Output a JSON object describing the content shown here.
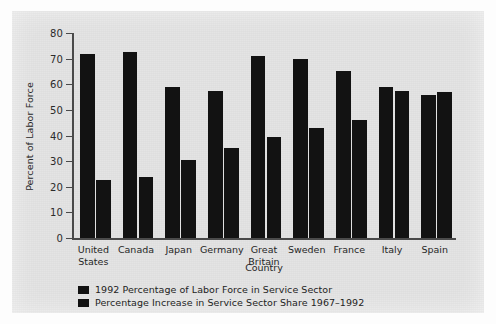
{
  "chart_data": {
    "type": "bar",
    "title": "",
    "xlabel": "Country",
    "ylabel": "Percent of Labor Force",
    "ylim": [
      0,
      80
    ],
    "yticks": [
      0,
      10,
      20,
      30,
      40,
      50,
      60,
      70,
      80
    ],
    "ytick_labels": [
      "0",
      "10",
      "20",
      "30",
      "40",
      "50",
      "60",
      "70",
      "80"
    ],
    "grid": false,
    "legend_position": "below-axis-left",
    "categories": [
      "United\nStates",
      "Canada",
      "Japan",
      "Germany",
      "Great\nBritain",
      "Sweden",
      "France",
      "Italy",
      "Spain"
    ],
    "category_names": [
      "United States",
      "Canada",
      "Japan",
      "Germany",
      "Great Britain",
      "Sweden",
      "France",
      "Italy",
      "Spain"
    ],
    "series": [
      {
        "name": "1992 Percentage of Labor Force in Service Sector",
        "color": "#121212",
        "values": [
          72,
          72.5,
          59,
          57.5,
          71,
          70,
          65,
          59,
          56
        ]
      },
      {
        "name": "Percentage Increase in Service Sector Share 1967–1992",
        "color": "#121212",
        "values": [
          22.5,
          24,
          30.5,
          35,
          39.5,
          43,
          46,
          57.5,
          57
        ]
      }
    ]
  },
  "legend": {
    "items": [
      {
        "label": "1992 Percentage of Labor Force in Service Sector"
      },
      {
        "label": "Percentage Increase in Service Sector Share 1967–1992"
      }
    ]
  },
  "colors": {
    "bar": "#121212",
    "panel": "#e3e3e3",
    "axis": "#4a4a4a",
    "text": "#262626"
  }
}
